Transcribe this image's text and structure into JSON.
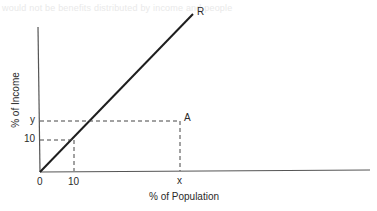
{
  "bleed_text": "would not be benefits distributed by income and people",
  "figure": {
    "x_axis_label": "% of Population",
    "y_axis_label": "% of Income",
    "origin_label": "0",
    "x_tick_labels": [
      "10",
      "x"
    ],
    "y_tick_labels": [
      "10",
      "y"
    ],
    "line_label": "R",
    "point_label": "A",
    "colors": {
      "axis": "#555555",
      "line": "#1e1e1e",
      "dashed": "#444444",
      "text": "#2a2a2a"
    }
  }
}
